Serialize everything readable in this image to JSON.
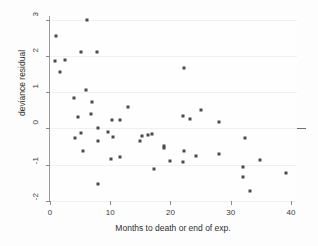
{
  "chart_data": {
    "type": "scatter",
    "title": "",
    "xlabel": "Months to death or end of exp.",
    "ylabel": "deviance residual",
    "xlim": [
      0,
      41
    ],
    "ylim": [
      -2,
      3.1
    ],
    "xticks": [
      0,
      10,
      20,
      30,
      40
    ],
    "xtick_labels": [
      "0",
      "10",
      "20",
      "30",
      "40"
    ],
    "yticks": [
      -2,
      -1,
      0,
      1,
      2,
      3
    ],
    "ytick_labels": [
      "-2",
      "-1",
      "0",
      "1",
      "2",
      "3"
    ],
    "grid": "horizontal-faint",
    "legend": "none",
    "reference_line": {
      "orientation": "horizontal",
      "y": 0,
      "color": "#6e6e6e"
    },
    "marker": {
      "shape": "square",
      "size_px": 3,
      "color": "#4a4a4a"
    },
    "n_points": 56,
    "points": [
      {
        "x": 1.0,
        "y": 2.55
      },
      {
        "x": 0.9,
        "y": 1.87
      },
      {
        "x": 1.7,
        "y": 1.55
      },
      {
        "x": 2.5,
        "y": 1.9
      },
      {
        "x": 6.1,
        "y": 3.0
      },
      {
        "x": 5.2,
        "y": 2.12
      },
      {
        "x": 7.8,
        "y": 2.1
      },
      {
        "x": 4.0,
        "y": 0.84
      },
      {
        "x": 5.9,
        "y": 1.05
      },
      {
        "x": 6.9,
        "y": 0.73
      },
      {
        "x": 4.6,
        "y": 0.32
      },
      {
        "x": 6.8,
        "y": 0.39
      },
      {
        "x": 8.0,
        "y": 0.0
      },
      {
        "x": 10.3,
        "y": 0.23
      },
      {
        "x": 11.6,
        "y": 0.23
      },
      {
        "x": 12.9,
        "y": 0.58
      },
      {
        "x": 4.1,
        "y": -0.26
      },
      {
        "x": 5.1,
        "y": -0.13
      },
      {
        "x": 5.4,
        "y": -0.62
      },
      {
        "x": 7.9,
        "y": -0.35
      },
      {
        "x": 9.6,
        "y": -0.11
      },
      {
        "x": 10.4,
        "y": -0.23
      },
      {
        "x": 10.2,
        "y": -0.85
      },
      {
        "x": 11.6,
        "y": -0.8
      },
      {
        "x": 8.0,
        "y": -1.53
      },
      {
        "x": 15.2,
        "y": -0.21
      },
      {
        "x": 16.3,
        "y": -0.18
      },
      {
        "x": 17.0,
        "y": -0.15
      },
      {
        "x": 15.0,
        "y": -0.35
      },
      {
        "x": 19.0,
        "y": -0.48
      },
      {
        "x": 19.0,
        "y": -0.55
      },
      {
        "x": 17.2,
        "y": -1.12
      },
      {
        "x": 20.0,
        "y": -0.9
      },
      {
        "x": 22.0,
        "y": -0.92
      },
      {
        "x": 22.1,
        "y": 0.35
      },
      {
        "x": 22.3,
        "y": 1.68
      },
      {
        "x": 23.3,
        "y": 0.26
      },
      {
        "x": 25.1,
        "y": 0.52
      },
      {
        "x": 22.3,
        "y": -0.63
      },
      {
        "x": 24.3,
        "y": -0.75
      },
      {
        "x": 28.1,
        "y": 0.18
      },
      {
        "x": 28.1,
        "y": -0.7
      },
      {
        "x": 32.4,
        "y": -0.26
      },
      {
        "x": 32.1,
        "y": -1.07
      },
      {
        "x": 32.0,
        "y": -1.34
      },
      {
        "x": 33.2,
        "y": -1.72
      },
      {
        "x": 34.9,
        "y": -0.88
      },
      {
        "x": 39.1,
        "y": -1.23
      }
    ]
  }
}
